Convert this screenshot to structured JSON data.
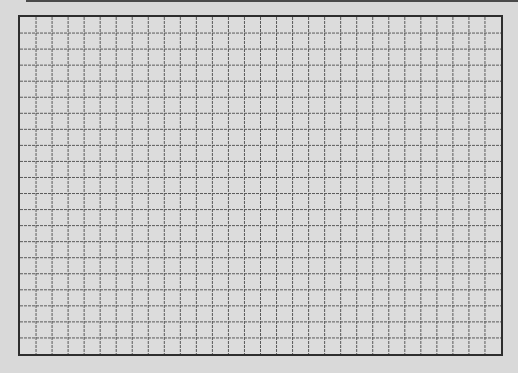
{
  "sheet": {
    "type": "graph-paper-grid",
    "columns": 30,
    "rows": 21,
    "colors": {
      "background": "#d9d9d9",
      "paper": "#dcdcdc",
      "border": "#2e2e2e",
      "grid_line": "#5a5a5a",
      "top_edge": "#4a4a4a"
    }
  }
}
